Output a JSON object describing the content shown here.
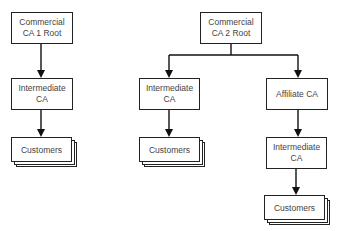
{
  "diagram": {
    "left_tree": {
      "root": {
        "label": "Commercial\nCA 1 Root"
      },
      "intermediate": {
        "label": "Intermediate\nCA"
      },
      "customers": {
        "label": "Customers"
      }
    },
    "right_tree": {
      "root": {
        "label": "Commercial\nCA 2 Root"
      },
      "left_branch": {
        "intermediate": {
          "label": "Intermediate\nCA"
        },
        "customers": {
          "label": "Customers"
        }
      },
      "right_branch": {
        "affiliate": {
          "label": "Affiliate CA"
        },
        "intermediate": {
          "label": "Intermediate\nCA"
        },
        "customers": {
          "label": "Customers"
        }
      }
    },
    "colors": {
      "stroke": "#222222",
      "text": "#444444",
      "background": "#ffffff"
    }
  }
}
